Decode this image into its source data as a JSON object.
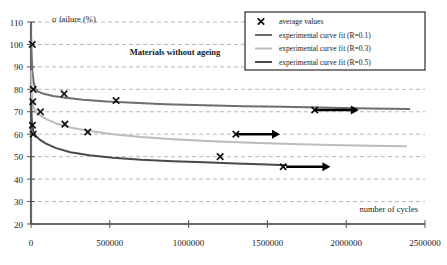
{
  "chart_data": {
    "type": "line",
    "title": "Materials without ageing",
    "xlabel": "number of cycles",
    "ylabel": "σ failure (%)",
    "xlim": [
      0,
      2500000
    ],
    "ylim": [
      20,
      110
    ],
    "xticks": [
      0,
      500000,
      1000000,
      1500000,
      2000000,
      2500000
    ],
    "xtick_labels": [
      "0",
      "500000",
      "1000000",
      "1500000",
      "2000000",
      "2500000"
    ],
    "yticks": [
      20,
      30,
      40,
      50,
      60,
      70,
      80,
      90,
      100,
      110
    ],
    "ytick_labels": [
      "20",
      "30",
      "40",
      "50",
      "60",
      "70",
      "80",
      "90",
      "100",
      "110"
    ],
    "grid": true,
    "grid_style": "dashed",
    "legend_position": "top-right",
    "series": [
      {
        "name": "experimental curve fit (R=0.1)",
        "color": "#6e6e6e",
        "width": 2.0,
        "points": [
          [
            1000,
            103.0
          ],
          [
            4000,
            95.0
          ],
          [
            9000,
            88.0
          ],
          [
            16000,
            83.5
          ],
          [
            26000,
            80.5
          ],
          [
            45000,
            79.0
          ],
          [
            80000,
            78.0
          ],
          [
            140000,
            77.0
          ],
          [
            220000,
            76.2
          ],
          [
            330000,
            75.4
          ],
          [
            480000,
            74.6
          ],
          [
            650000,
            74.0
          ],
          [
            850000,
            73.4
          ],
          [
            1100000,
            72.9
          ],
          [
            1350000,
            72.5
          ],
          [
            1600000,
            72.2
          ],
          [
            1900000,
            71.8
          ],
          [
            2150000,
            71.5
          ],
          [
            2400000,
            71.2
          ]
        ]
      },
      {
        "name": "experimental curve fit (R=0.3)",
        "color": "#bcbcbc",
        "width": 2.0,
        "points": [
          [
            1000,
            88.0
          ],
          [
            4000,
            80.0
          ],
          [
            9000,
            75.0
          ],
          [
            16000,
            72.0
          ],
          [
            30000,
            70.0
          ],
          [
            55000,
            68.5
          ],
          [
            95000,
            66.8
          ],
          [
            160000,
            64.8
          ],
          [
            250000,
            63.0
          ],
          [
            370000,
            61.4
          ],
          [
            520000,
            60.0
          ],
          [
            700000,
            58.8
          ],
          [
            900000,
            57.8
          ],
          [
            1150000,
            56.9
          ],
          [
            1400000,
            56.2
          ],
          [
            1650000,
            55.6
          ],
          [
            1900000,
            55.2
          ],
          [
            2150000,
            54.9
          ],
          [
            2380000,
            54.6
          ]
        ]
      },
      {
        "name": "experimental curve fit (R=0.5)",
        "color": "#4a4a4a",
        "width": 2.0,
        "points": [
          [
            1000,
            75.0
          ],
          [
            4000,
            67.0
          ],
          [
            9000,
            63.0
          ],
          [
            16000,
            61.0
          ],
          [
            30000,
            59.3
          ],
          [
            55000,
            57.6
          ],
          [
            95000,
            55.8
          ],
          [
            160000,
            53.8
          ],
          [
            250000,
            52.0
          ],
          [
            370000,
            50.6
          ],
          [
            520000,
            49.5
          ],
          [
            700000,
            48.6
          ],
          [
            900000,
            48.0
          ],
          [
            1100000,
            47.5
          ],
          [
            1300000,
            47.0
          ],
          [
            1500000,
            46.5
          ],
          [
            1620000,
            46.2
          ]
        ]
      }
    ],
    "average_values": {
      "name": "average values",
      "marker": "x",
      "color": "#111111",
      "points": [
        [
          8000,
          100.0
        ],
        [
          14000,
          80.0
        ],
        [
          11000,
          74.5
        ],
        [
          9000,
          64.0
        ],
        [
          14000,
          60.0
        ],
        [
          60000,
          70.0
        ],
        [
          210000,
          78.0
        ],
        [
          215000,
          64.5
        ],
        [
          540000,
          75.0
        ],
        [
          360000,
          61.0
        ],
        [
          1200000,
          50.0
        ],
        [
          1600000,
          45.5
        ],
        [
          1800000,
          70.8
        ],
        [
          1300000,
          60.0
        ]
      ]
    },
    "arrows": [
      {
        "x_start": 1800000,
        "x_end": 2080000,
        "y": 70.8
      },
      {
        "x_start": 1300000,
        "x_end": 1580000,
        "y": 60.0
      },
      {
        "x_start": 1620000,
        "x_end": 1900000,
        "y": 45.5
      }
    ]
  },
  "legend": {
    "entries": [
      {
        "label": "average values",
        "type": "marker"
      },
      {
        "label": "experimental curve fit (R=0.1)",
        "type": "line"
      },
      {
        "label": "experimental curve fit (R=0.3)",
        "type": "line"
      },
      {
        "label": "experimental curve fit (R=0.5)",
        "type": "line"
      }
    ]
  }
}
